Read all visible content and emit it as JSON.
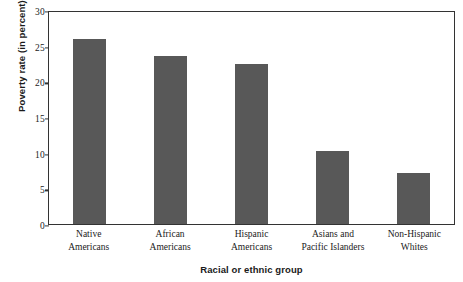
{
  "chart_data": {
    "type": "bar",
    "title": "",
    "xlabel": "Racial or ethnic group",
    "ylabel": "Poverty rate (in percent)",
    "categories": [
      "Native Americans",
      "African Americans",
      "Hispanic Americans",
      "Asians and Pacific Islanders",
      "Non-Hispanic Whites"
    ],
    "category_lines": [
      [
        "Native",
        "Americans"
      ],
      [
        "African",
        "Americans"
      ],
      [
        "Hispanic",
        "Americans"
      ],
      [
        "Asians and",
        "Pacific Islanders"
      ],
      [
        "Non-Hispanic",
        "Whites"
      ]
    ],
    "values": [
      26.0,
      23.6,
      22.5,
      10.3,
      7.1
    ],
    "ylim": [
      0,
      30
    ],
    "yticks": [
      0,
      5,
      10,
      15,
      20,
      25,
      30
    ],
    "ytick_labels": [
      "0",
      "5",
      "10",
      "15",
      "20",
      "25",
      "30"
    ],
    "grid": false,
    "legend": "none",
    "bar_color": "#585858",
    "frame_color": "#333333",
    "background": "#ffffff"
  }
}
